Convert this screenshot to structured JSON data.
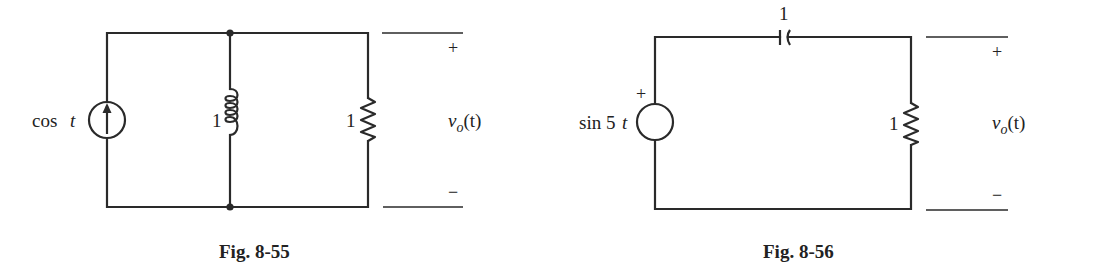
{
  "figures": [
    {
      "caption": "Fig. 8-55",
      "source": {
        "type": "current-source",
        "label_fn": "cos",
        "label_var": "t",
        "direction": "up"
      },
      "inductor": {
        "value": "1"
      },
      "resistor": {
        "value": "1"
      },
      "output": {
        "plus": "+",
        "minus": "−",
        "v": "v",
        "sub": "o",
        "arg": "(t)"
      }
    },
    {
      "caption": "Fig. 8-56",
      "source": {
        "type": "voltage-source",
        "label_fn": "sin 5",
        "label_var": "t",
        "polarity": "+"
      },
      "capacitor": {
        "value": "1"
      },
      "resistor": {
        "value": "1"
      },
      "output": {
        "plus": "+",
        "minus": "−",
        "v": "v",
        "sub": "o",
        "arg": "(t)"
      }
    }
  ]
}
